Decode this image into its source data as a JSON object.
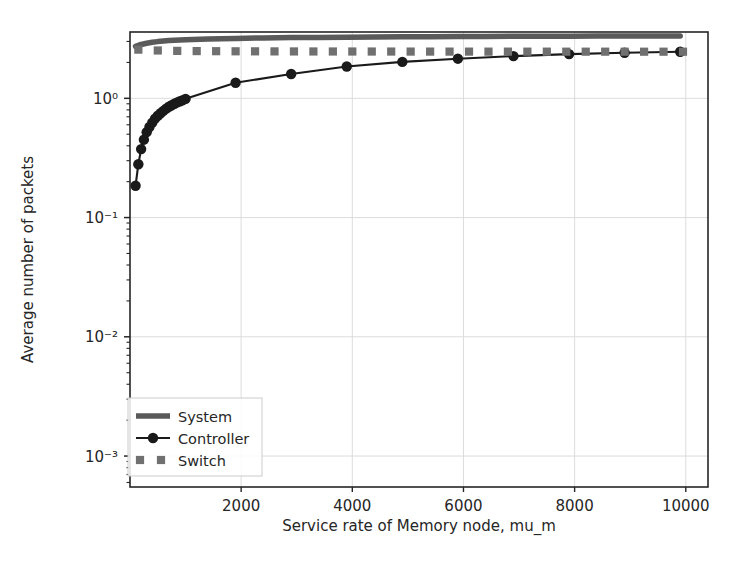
{
  "chart_data": {
    "type": "line",
    "title": "",
    "xlabel": "Service rate of Memory node, mu_m",
    "ylabel": "Average number of packets",
    "xscale": "linear",
    "yscale": "log",
    "xlim": [
      0,
      10400
    ],
    "ylim": [
      0.00055,
      3.6
    ],
    "xticks": [
      2000,
      4000,
      6000,
      8000,
      10000
    ],
    "xtick_labels": [
      "2000",
      "4000",
      "6000",
      "8000",
      "10000"
    ],
    "yticks": [
      1,
      0.1,
      0.01,
      0.001
    ],
    "ytick_labels": [
      "10⁰",
      "10⁻¹",
      "10⁻²",
      "10⁻³"
    ],
    "grid": true,
    "legend_position": "lower left",
    "series": [
      {
        "name": "System",
        "style": "thick-line",
        "color": "#5a5a5a",
        "marker": "none",
        "x": [
          100,
          200,
          300,
          400,
          500,
          600,
          700,
          800,
          900,
          1000,
          1400,
          1900,
          2400,
          2900,
          3400,
          3900,
          4400,
          4900,
          5400,
          5900,
          6400,
          6900,
          7400,
          7900,
          8400,
          8900,
          9400,
          9900
        ],
        "y": [
          2.73,
          2.83,
          2.9,
          2.95,
          2.99,
          3.02,
          3.05,
          3.07,
          3.09,
          3.105,
          3.15,
          3.18,
          3.21,
          3.23,
          3.245,
          3.26,
          3.27,
          3.28,
          3.29,
          3.3,
          3.305,
          3.31,
          3.315,
          3.32,
          3.325,
          3.33,
          3.335,
          3.34
        ]
      },
      {
        "name": "Controller",
        "style": "line-marker",
        "color": "#1a1a1a",
        "marker": "circle",
        "x": [
          100,
          150,
          200,
          250,
          300,
          350,
          400,
          450,
          500,
          550,
          600,
          650,
          700,
          750,
          800,
          850,
          900,
          950,
          1000,
          1900,
          2900,
          3900,
          4900,
          5900,
          6900,
          7900,
          8900,
          9900
        ],
        "y": [
          0.185,
          0.28,
          0.375,
          0.45,
          0.52,
          0.575,
          0.625,
          0.675,
          0.715,
          0.75,
          0.785,
          0.82,
          0.85,
          0.875,
          0.9,
          0.925,
          0.945,
          0.965,
          0.99,
          1.35,
          1.6,
          1.85,
          2.02,
          2.15,
          2.26,
          2.35,
          2.41,
          2.46
        ]
      },
      {
        "name": "Switch",
        "style": "markers",
        "color": "#707070",
        "marker": "square",
        "x": [
          150,
          500,
          850,
          1200,
          1550,
          1900,
          2250,
          2600,
          2950,
          3300,
          3650,
          4000,
          4350,
          4700,
          5050,
          5400,
          5750,
          6100,
          6450,
          6800,
          7150,
          7500,
          7850,
          8200,
          8550,
          8900,
          9250,
          9600,
          9950
        ],
        "y": [
          2.56,
          2.52,
          2.5,
          2.49,
          2.485,
          2.48,
          2.478,
          2.475,
          2.473,
          2.472,
          2.471,
          2.47,
          2.469,
          2.468,
          2.467,
          2.466,
          2.465,
          2.465,
          2.464,
          2.464,
          2.463,
          2.463,
          2.462,
          2.462,
          2.462,
          2.461,
          2.461,
          2.461,
          2.46
        ]
      }
    ],
    "legend_entries": [
      {
        "label": "System",
        "color": "#5a5a5a",
        "style": "thick-line"
      },
      {
        "label": "Controller",
        "color": "#1a1a1a",
        "style": "line-marker"
      },
      {
        "label": "Switch",
        "color": "#707070",
        "style": "markers"
      }
    ],
    "colors": {
      "axis": "#262626",
      "grid": "#d8d8d8",
      "background": "#ffffff",
      "system": "#5a5a5a",
      "controller": "#1a1a1a",
      "switch": "#707070"
    }
  }
}
